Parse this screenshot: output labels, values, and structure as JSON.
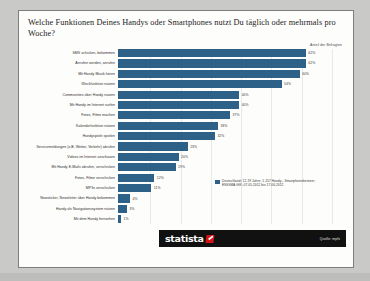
{
  "chart_data": {
    "type": "bar",
    "orientation": "horizontal",
    "title": "Welche Funktionen Deines Handys oder Smartphones nutzt Du täglich oder mehrmals pro Woche?",
    "xlabel": "Anteil der Befragten",
    "ylabel": "",
    "xlim": [
      0,
      70
    ],
    "grid": true,
    "legend_position": "bottom-right",
    "value_suffix": "%",
    "categories": [
      "SMS schicken, bekommen",
      "Anrufen werden, anrufen",
      "Mit Handy Musik hören",
      "Weckfunktion nutzen",
      "Communities über Handy nutzen",
      "Mit Handy im Internet surfen",
      "Fotos, Filme machen",
      "Kalenderfunktion nutzen",
      "Handyspiele spielen",
      "Servicemeldungen (z.B. Wetter, Verkehr) abrufen",
      "Videos im Internet anschauen",
      "Mit Handy E-Mails abrufen, verschicken",
      "Fotos, Filme verschicken",
      "MP3s verschicken",
      "Newsticker, Newsletter über Handy bekommen",
      "Handy als Navigationssystem nutzen",
      "Mit dem Handy fernsehen"
    ],
    "values": [
      62,
      62,
      60,
      54,
      40,
      40,
      37,
      33,
      32,
      23,
      20,
      19,
      12,
      11,
      4,
      3,
      1
    ],
    "value_labels": [
      "62%",
      "62%",
      "60%",
      "54%",
      "40%",
      "40%",
      "37%",
      "33%",
      "32%",
      "23%",
      "20%",
      "19%",
      "12%",
      "11%",
      "4%",
      "3%",
      "1%"
    ],
    "series_name": "Deutschland; 12-19 Jahre; 1.157 Handy-, Smartphonebesitzer",
    "bar_color": "#2e6187"
  },
  "legend": {
    "line1": "Deutschland; 12-19 Jahre; 1.157 Handy-, Smartphonebesitzer;",
    "line2": "ENIGMA GfK; 07.05.2012 bis 17.06.2012"
  },
  "footer": {
    "logo_text": "statista",
    "source": "Quelle: mpfs"
  }
}
